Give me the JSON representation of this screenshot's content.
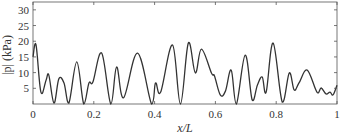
{
  "chart_data": {
    "type": "line",
    "title": "",
    "xlabel": "x/L",
    "ylabel": "|p| (kPa)",
    "xlim": [
      0,
      1
    ],
    "ylim": [
      0,
      32.5
    ],
    "grid": false,
    "legend": null,
    "x_ticks": [
      0,
      0.2,
      0.4,
      0.6,
      0.8,
      1
    ],
    "x_tick_labels": [
      "0",
      "0.2",
      "0.4",
      "0.6",
      "0.8",
      "1"
    ],
    "y_ticks": [
      5,
      10,
      15,
      20,
      25,
      30
    ],
    "y_tick_labels": [
      "5",
      "10",
      "15",
      "20",
      "25",
      "30"
    ],
    "series": [
      {
        "name": "|p|",
        "color": "#333333",
        "x": [
          0,
          0.01,
          0.026,
          0.043,
          0.052,
          0.069,
          0.085,
          0.102,
          0.118,
          0.144,
          0.167,
          0.184,
          0.197,
          0.226,
          0.256,
          0.275,
          0.298,
          0.344,
          0.39,
          0.403,
          0.42,
          0.459,
          0.485,
          0.511,
          0.534,
          0.554,
          0.587,
          0.597,
          0.616,
          0.633,
          0.652,
          0.669,
          0.698,
          0.721,
          0.738,
          0.754,
          0.767,
          0.79,
          0.82,
          0.843,
          0.859,
          0.875,
          0.902,
          0.934,
          0.948,
          0.964,
          0.977,
          0.987,
          1.0
        ],
        "y": [
          15,
          18.8,
          3.8,
          7.6,
          9.2,
          0.3,
          8,
          6.7,
          0.3,
          13.4,
          0,
          6.7,
          7,
          16.2,
          0,
          11.8,
          2,
          16.2,
          0,
          6.7,
          3.8,
          18.8,
          0,
          19.4,
          9.9,
          17.5,
          9.9,
          8.9,
          2.9,
          4.1,
          10.8,
          0,
          15.6,
          1.3,
          6,
          8.6,
          3.8,
          19.4,
          0.6,
          9.9,
          4.5,
          6.7,
          10.8,
          3.8,
          5.1,
          3.2,
          3.8,
          2.9,
          6
        ]
      }
    ]
  }
}
